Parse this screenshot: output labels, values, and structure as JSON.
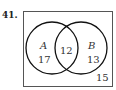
{
  "problem_number": "41.",
  "venn": {
    "sets": [
      {
        "name": "A",
        "only_count": "17"
      },
      {
        "name": "B",
        "only_count": "13"
      }
    ],
    "intersection": "12",
    "outside": "15"
  }
}
